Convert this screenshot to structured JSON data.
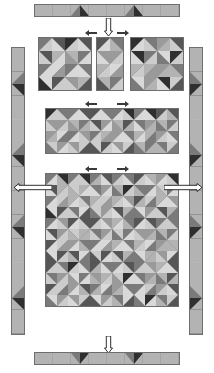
{
  "figure": {
    "background": "#ffffff",
    "outline_color": "#6e6e6e"
  },
  "palette": {
    "light": "#d9d9d9",
    "light2": "#cccccc",
    "mid_light": "#b3b3b3",
    "mid": "#9a9a9a",
    "mid_dark": "#7a7a7a",
    "dark": "#565656",
    "darkest": "#2f2f2f",
    "outline": "#6e6e6e",
    "arrow_fill": "#ffffff",
    "arrow_stroke": "#1a1a1a"
  },
  "sections": {
    "top_border_strip": {
      "name": "top pieced border strip",
      "segments": 8,
      "motif": "dark triangle peaks on light ground",
      "accent_positions": [
        2,
        5
      ]
    },
    "bottom_border_strip": {
      "name": "bottom pieced border strip",
      "segments": 8,
      "motif": "dark triangle valleys on light ground",
      "accent_positions": [
        2,
        5
      ]
    },
    "left_border_strip": {
      "name": "left pieced border strip",
      "segments": 12,
      "motif": "dark triangles pointing right",
      "accent_positions": [
        1,
        4,
        7,
        10
      ]
    },
    "right_border_strip": {
      "name": "right pieced border strip",
      "segments": 12,
      "motif": "dark triangles pointing left",
      "accent_positions": [
        1,
        4,
        7,
        10
      ]
    },
    "row_blocks": {
      "name": "three sample blocks row",
      "blocks": [
        {
          "label": "block A",
          "grid": "4x4 half-square triangles"
        },
        {
          "label": "half block",
          "grid": "2x4 half-square triangles"
        },
        {
          "label": "block B",
          "grid": "4x4 half-square triangles"
        }
      ]
    },
    "row_strip": {
      "name": "assembled block row",
      "blocks": 3,
      "grid": "12x4 half-square triangles"
    },
    "quilt_center": {
      "name": "quilt centre",
      "blocks": 9,
      "layout": "3 by 3 blocks",
      "grid": "12x12 half-square triangles"
    }
  },
  "arrows": [
    {
      "name": "arrow-top-down",
      "direction": "down"
    },
    {
      "name": "arrow-row1-left",
      "direction": "left"
    },
    {
      "name": "arrow-row1-right",
      "direction": "right"
    },
    {
      "name": "arrow-row1-up",
      "direction": "up"
    },
    {
      "name": "arrow-row2-left",
      "direction": "left"
    },
    {
      "name": "arrow-row2-right",
      "direction": "right"
    },
    {
      "name": "arrow-row3-left",
      "direction": "left"
    },
    {
      "name": "arrow-row3-right",
      "direction": "right"
    },
    {
      "name": "arrow-side-left",
      "direction": "left"
    },
    {
      "name": "arrow-side-right",
      "direction": "right"
    },
    {
      "name": "arrow-bottom-down",
      "direction": "down"
    }
  ],
  "block_patterns": {
    "note": "Each block cell holds two half-square triangles; values are palette keys for [upper/left, lower/right] and the diagonal orientation.",
    "block_a": [
      [
        "mid_dark:light:tl",
        "light:mid:tr",
        "mid:light:tl",
        "dark:light2:tr"
      ],
      [
        "light:dark:tr",
        "light2:mid_dark:tl",
        "mid_dark:light2:tr",
        "light:mid_dark:tl"
      ],
      [
        "mid:light:tr",
        "mid_dark:light2:tl",
        "light2:mid:tr",
        "light:dark:tl"
      ],
      [
        "dark:light2:tl",
        "light:mid_dark:tr",
        "mid_dark:light:tl",
        "mid:light2:tr"
      ]
    ],
    "block_b": [
      [
        "dark:light:tr",
        "light2:mid:tl",
        "mid_dark:light:tr",
        "mid:light2:tl"
      ],
      [
        "light:mid_dark:tl",
        "darkest:light2:tr",
        "light:dark:tl",
        "light2:mid_dark:tr"
      ],
      [
        "mid:light2:tl",
        "light:darkest:tr",
        "light2:mid:tl",
        "dark:light:tr"
      ],
      [
        "light2:dark:tr",
        "mid_dark:light:tl",
        "mid:light2:tr",
        "light:mid_dark:tl"
      ]
    ],
    "half_block": [
      [
        "mid_light:light:tr",
        "light:mid_light:tl"
      ],
      [
        "dark:light2:tl",
        "light2:dark:tr"
      ],
      [
        "darkest:light:tr",
        "light:darkest:tl"
      ],
      [
        "light2:mid:tl",
        "mid:light2:tr"
      ]
    ]
  }
}
